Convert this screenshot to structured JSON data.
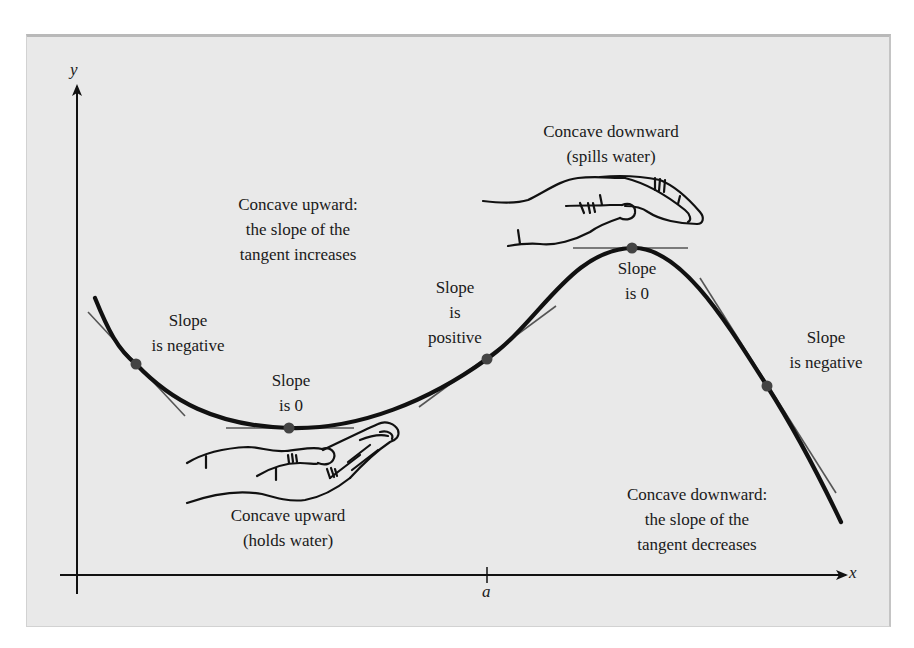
{
  "figure": {
    "background_color": "#e9e9e9",
    "curve_color": "#111111",
    "tangent_color": "#555555",
    "point_color": "#444444"
  },
  "axes": {
    "x_label": "x",
    "y_label": "y",
    "tick_label": "a"
  },
  "labels": {
    "slope_negative_left": {
      "line1": "Slope",
      "line2": "is negative"
    },
    "slope_zero_min": {
      "line1": "Slope",
      "line2": "is 0"
    },
    "slope_positive": {
      "line1": "Slope",
      "line2": "is",
      "line3": "positive"
    },
    "slope_zero_max": {
      "line1": "Slope",
      "line2": "is 0"
    },
    "slope_negative_right": {
      "line1": "Slope",
      "line2": "is negative"
    },
    "concave_up_note": {
      "line1": "Concave upward:",
      "line2": "the slope of the",
      "line3": "tangent increases"
    },
    "concave_up_hand": {
      "line1": "Concave upward",
      "line2": "(holds water)"
    },
    "concave_down_hand": {
      "line1": "Concave downward",
      "line2": "(spills water)"
    },
    "concave_down_note": {
      "line1": "Concave downward:",
      "line2": "the slope of the",
      "line3": "tangent decreases"
    }
  },
  "points": [
    {
      "name": "left-negative-slope",
      "x": 136,
      "y": 364,
      "slope": "negative"
    },
    {
      "name": "local-minimum",
      "x": 289,
      "y": 428,
      "slope": "zero"
    },
    {
      "name": "inflection-at-a",
      "x": 487,
      "y": 359,
      "slope": "positive"
    },
    {
      "name": "local-maximum",
      "x": 632,
      "y": 248,
      "slope": "zero"
    },
    {
      "name": "right-negative-slope",
      "x": 767,
      "y": 386,
      "slope": "negative"
    }
  ]
}
